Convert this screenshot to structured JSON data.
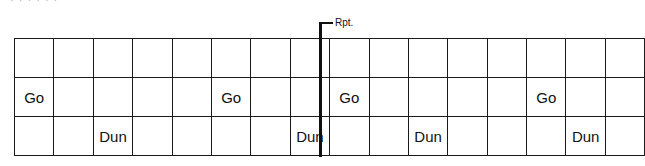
{
  "header": {
    "cutoff_text": "· · · · · ·"
  },
  "repeat_marker": {
    "label": "Rpt.",
    "after_column": 8
  },
  "grid": {
    "columns": 16,
    "rows": [
      [
        "",
        "",
        "",
        "",
        "",
        "",
        "",
        "",
        "",
        "",
        "",
        "",
        "",
        "",
        "",
        ""
      ],
      [
        "Go",
        "",
        "",
        "",
        "",
        "Go",
        "",
        "",
        "Go",
        "",
        "",
        "",
        "",
        "Go",
        "",
        ""
      ],
      [
        "",
        "",
        "Dun",
        "",
        "",
        "",
        "",
        "Dun",
        "",
        "",
        "Dun",
        "",
        "",
        "",
        "Dun",
        ""
      ]
    ]
  },
  "colors": {
    "line": "#1a1a1a",
    "text": "#111111",
    "background": "#ffffff"
  }
}
